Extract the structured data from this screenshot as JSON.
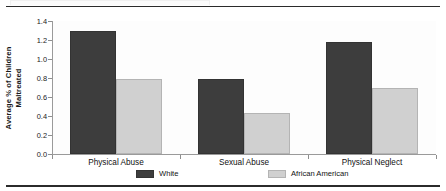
{
  "figure": {
    "ghost_strip_name": "cropped-page-element",
    "rule_top_name": "top-rule",
    "rule_bottom_name": "bottom-rule"
  },
  "chart_data": {
    "type": "bar",
    "title": "",
    "subtitle": "",
    "xlabel": "",
    "ylabel": "Average % of Children Maltreated",
    "ylabel_lines": [
      "Average % of Children",
      "Maltreated"
    ],
    "categories": [
      "Physical Abuse",
      "Sexual Abuse",
      "Physical Neglect"
    ],
    "series": [
      {
        "name": "White",
        "color": "#3d3d3d",
        "values": [
          1.29,
          0.79,
          1.18
        ]
      },
      {
        "name": "African American",
        "color": "#d0d0d0",
        "values": [
          0.79,
          0.43,
          0.69
        ]
      }
    ],
    "ylim": [
      0.0,
      1.4
    ],
    "yticks": [
      0.0,
      0.2,
      0.4,
      0.6,
      0.8,
      1.0,
      1.2,
      1.4
    ],
    "ytick_labels": [
      "0.0",
      "0.2",
      "0.4",
      "0.6",
      "0.8",
      "1.0",
      "1.2",
      "1.4"
    ],
    "grid": false,
    "legend_position": "bottom",
    "bar_edge_color": "#333333",
    "background_color": "#ffffff"
  }
}
